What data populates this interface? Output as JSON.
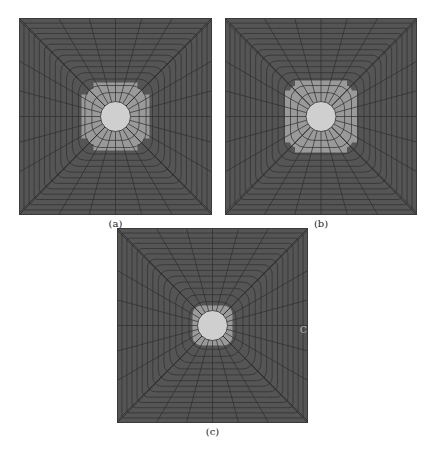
{
  "figure": {
    "panels": [
      {
        "id": "a",
        "caption": "(a)",
        "x": 19,
        "y": 18,
        "w": 193,
        "h": 197,
        "zone": "large-plus",
        "zone_half": 34,
        "notch": 12
      },
      {
        "id": "b",
        "caption": "(b)",
        "x": 225,
        "y": 18,
        "w": 192,
        "h": 197,
        "zone": "plus-arms",
        "zone_half": 36,
        "notch": 10
      },
      {
        "id": "c",
        "caption": "(c)",
        "x": 117,
        "y": 228,
        "w": 191,
        "h": 195,
        "zone": "thin-ring",
        "zone_half": 20,
        "notch": 4
      }
    ],
    "colors": {
      "mesh_fill": "#555555",
      "mesh_line": "#2e2e2e",
      "zone_fill": "#9a9a9a",
      "hole_fill": "#cfcfcf",
      "caption": "#222222"
    },
    "hole_radius": 15,
    "radial_lines": 24,
    "rings": 14,
    "stray_mark": "C"
  }
}
